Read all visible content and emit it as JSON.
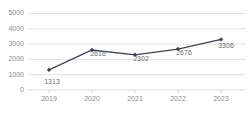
{
  "chart_data": {
    "type": "line",
    "title": "",
    "subtitle": "",
    "xlabel": "",
    "ylabel": "",
    "categories": [
      "2019",
      "2020",
      "2021",
      "2022",
      "2023"
    ],
    "values": [
      1313,
      2616,
      2302,
      2676,
      3306
    ],
    "series": [
      {
        "name": "",
        "values": [
          1313,
          2616,
          2302,
          2676,
          3306
        ]
      }
    ],
    "point_labels": [
      "1313",
      "2616",
      "2302",
      "2676",
      "3306"
    ],
    "ylim": [
      0,
      5000
    ],
    "ytick_labels": [
      "0",
      "1000",
      "2000",
      "3000",
      "4000",
      "5000"
    ],
    "ytick_values": [
      0,
      1000,
      2000,
      3000,
      4000,
      5000
    ],
    "xtick_labels": [
      "2019",
      "2020",
      "2021",
      "2022",
      "2023"
    ],
    "grid": "horizontal",
    "legend": "none",
    "marker": "diamond",
    "colors": {
      "line": "#3d4450",
      "marker": "#3d4450",
      "gridline": "#d4d4d4",
      "axis": "#c9c9c9",
      "tick_text": "#8a8a8a",
      "value_text": "#6e6e6e",
      "background": "#ffffff"
    }
  }
}
